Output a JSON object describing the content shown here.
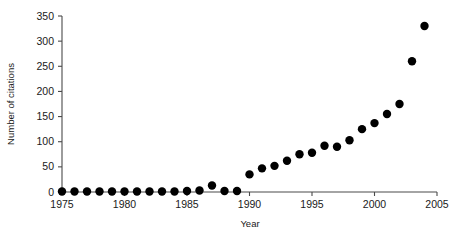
{
  "chart_data": {
    "type": "scatter",
    "title": "",
    "xlabel": "Year",
    "ylabel": "Number of citations",
    "xlim": [
      1975,
      2005
    ],
    "ylim": [
      0,
      350
    ],
    "xticks": [
      1975,
      1980,
      1985,
      1990,
      1995,
      2000,
      2005
    ],
    "xticklabels": [
      "1975",
      "1980",
      "1985",
      "1990",
      "1995",
      "2000",
      "2005"
    ],
    "yticks": [
      0,
      50,
      100,
      150,
      200,
      250,
      300,
      350
    ],
    "yticklabels": [
      "0",
      "50",
      "100",
      "150",
      "200",
      "250",
      "300",
      "350"
    ],
    "grid": false,
    "legend": null,
    "marker": "filled-circle",
    "marker_color": "#000000",
    "x": [
      1975,
      1976,
      1977,
      1978,
      1979,
      1980,
      1981,
      1982,
      1983,
      1984,
      1985,
      1986,
      1987,
      1988,
      1989,
      1990,
      1991,
      1992,
      1993,
      1994,
      1995,
      1996,
      1997,
      1998,
      1999,
      2000,
      2001,
      2002,
      2003,
      2004
    ],
    "y": [
      1,
      1,
      1,
      1,
      1,
      1,
      1,
      1,
      1,
      1,
      2,
      3,
      13,
      2,
      2,
      35,
      47,
      52,
      62,
      75,
      78,
      92,
      90,
      103,
      125,
      137,
      155,
      175,
      260,
      330
    ],
    "points": [
      {
        "year": 1975,
        "citations": 1
      },
      {
        "year": 1976,
        "citations": 1
      },
      {
        "year": 1977,
        "citations": 1
      },
      {
        "year": 1978,
        "citations": 1
      },
      {
        "year": 1979,
        "citations": 1
      },
      {
        "year": 1980,
        "citations": 1
      },
      {
        "year": 1981,
        "citations": 1
      },
      {
        "year": 1982,
        "citations": 1
      },
      {
        "year": 1983,
        "citations": 1
      },
      {
        "year": 1984,
        "citations": 1
      },
      {
        "year": 1985,
        "citations": 2
      },
      {
        "year": 1986,
        "citations": 3
      },
      {
        "year": 1987,
        "citations": 13
      },
      {
        "year": 1988,
        "citations": 2
      },
      {
        "year": 1989,
        "citations": 2
      },
      {
        "year": 1990,
        "citations": 35
      },
      {
        "year": 1991,
        "citations": 47
      },
      {
        "year": 1992,
        "citations": 52
      },
      {
        "year": 1993,
        "citations": 62
      },
      {
        "year": 1994,
        "citations": 75
      },
      {
        "year": 1995,
        "citations": 78
      },
      {
        "year": 1996,
        "citations": 92
      },
      {
        "year": 1997,
        "citations": 90
      },
      {
        "year": 1998,
        "citations": 103
      },
      {
        "year": 1999,
        "citations": 125
      },
      {
        "year": 2000,
        "citations": 137
      },
      {
        "year": 2001,
        "citations": 155
      },
      {
        "year": 2002,
        "citations": 175
      },
      {
        "year": 2003,
        "citations": 260
      },
      {
        "year": 2004,
        "citations": 330
      }
    ]
  }
}
